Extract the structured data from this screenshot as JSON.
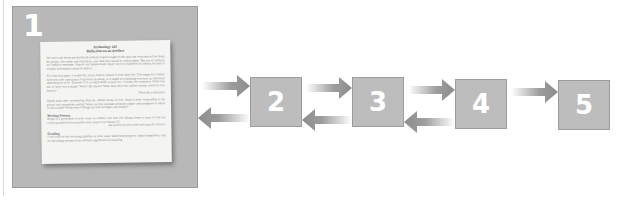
{
  "diagram": {
    "type": "process-flow",
    "steps": [
      {
        "number": "1",
        "kind": "document-thumbnail"
      },
      {
        "number": "2"
      },
      {
        "number": "3"
      },
      {
        "number": "4"
      },
      {
        "number": "5"
      }
    ],
    "connections": [
      {
        "from": "1",
        "to": "2",
        "direction": "forward"
      },
      {
        "from": "2",
        "to": "1",
        "direction": "back"
      },
      {
        "from": "2",
        "to": "3",
        "direction": "forward"
      },
      {
        "from": "3",
        "to": "2",
        "direction": "back"
      },
      {
        "from": "3",
        "to": "4",
        "direction": "forward"
      },
      {
        "from": "4",
        "to": "3",
        "direction": "back"
      },
      {
        "from": "4",
        "to": "5",
        "direction": "forward"
      }
    ],
    "colors": {
      "box_fill": "#bdbdbd",
      "box_border": "#9c9c9c",
      "arrow": "#8c8c8c",
      "number_text": "#ffffff"
    }
  },
  "document": {
    "title_line1": "Archeology 201",
    "title_line2": "Reflection on an Artifact",
    "paragraphs": [
      "We have read about and discussed artifacts at great length in this unit and what they tell us about the people who made and used them, and what they meant to archeologists. But not all artifacts are found in museums. Almost any human-made object can be considered an artifact, because it contains information about its makers.",
      "For your first paper, I would like you to find an artifact in your daily life. This might be a family heirloom with a great deal of personal meaning, or it might be something you have an emotional attachment to at all. Describe it in as much detail as you can. Consider the context in which you use it. Why was it made? When? By whom? What clues does the artifact contain about its own history?",
      "Spend some time considering what the artifact means to you. What is your relationship to the person who created the artifact? What can you conclude about the culture and conditions in which it was created? What sorts of things can you not figure out about it?"
    ],
    "margin_note": "Think like a detective!",
    "sections": [
      {
        "heading": "Writing Process",
        "text": "Bring in a good draft of your essay on October 3rd. You will discuss them in class so you can revise carefully before you turn your essay in on October 15."
      },
      {
        "heading": "Grading",
        "text": "I will look for the following qualities in your essay: detailed description, logical deductions, and an interesting account of the artifact's significance to meaning."
      }
    ],
    "side_note": "See section for first week and notes for revision"
  }
}
